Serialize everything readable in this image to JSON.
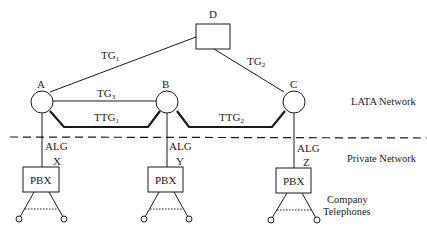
{
  "nodes": {
    "A": {
      "label": "A"
    },
    "B": {
      "label": "B"
    },
    "C": {
      "label": "C"
    },
    "D": {
      "label": "D"
    }
  },
  "trunks": {
    "tg1": {
      "base": "TG",
      "sub": "1"
    },
    "tg2": {
      "base": "TG",
      "sub": "2"
    },
    "tg3": {
      "base": "TG",
      "sub": "3"
    },
    "ttg1": {
      "base": "TTG",
      "sub": "1"
    },
    "ttg2": {
      "base": "TTG",
      "sub": "2"
    }
  },
  "access_lines": {
    "alg_a": "ALG",
    "alg_b": "ALG",
    "alg_c": "ALG"
  },
  "pbx": {
    "x": {
      "id": "X",
      "label": "PBX"
    },
    "y": {
      "id": "Y",
      "label": "PBX"
    },
    "z": {
      "id": "Z",
      "label": "PBX"
    }
  },
  "regions": {
    "lata": "LATA Network",
    "private": "Private Network",
    "telephones_line1": "Company",
    "telephones_line2": "Telephones"
  },
  "colors": {
    "stroke": "#1a1a1a",
    "background": "#ffffff"
  }
}
